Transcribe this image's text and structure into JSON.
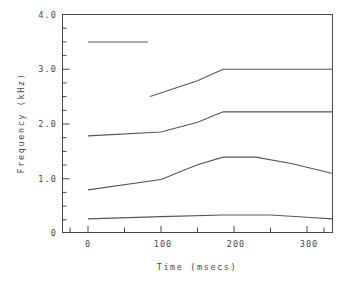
{
  "chart_data": {
    "type": "line",
    "title": "",
    "xlabel": "Time (msecs)",
    "ylabel": "Frequency (kHz)",
    "xlim": [
      -35,
      340
    ],
    "ylim": [
      0,
      4.0
    ],
    "grid": false,
    "legend": "none",
    "x_ticks": [
      0,
      100,
      200,
      300
    ],
    "x_tick_labels": [
      "0",
      "100",
      "200",
      "300"
    ],
    "x_minor_ticks": [
      -50,
      50,
      150,
      250,
      350
    ],
    "y_ticks": [
      0,
      1.0,
      2.0,
      3.0,
      4.0
    ],
    "y_tick_labels": [
      "0",
      "1.0",
      "2.0",
      "3.0",
      "4.0"
    ],
    "y_minor_ticks": [
      0.25,
      0.5,
      0.75,
      1.25,
      1.5,
      1.75,
      2.25,
      2.5,
      2.75,
      3.25,
      3.5,
      3.75
    ],
    "series": [
      {
        "name": "F4",
        "x": [
          0,
          82
        ],
        "values": [
          3.49,
          3.49
        ]
      },
      {
        "name": "F3",
        "x": [
          85,
          150,
          185,
          250,
          335
        ],
        "values": [
          2.49,
          2.78,
          2.99,
          2.99,
          2.99
        ]
      },
      {
        "name": "F2",
        "x": [
          0,
          100,
          150,
          185,
          250,
          335
        ],
        "values": [
          1.77,
          1.84,
          2.02,
          2.21,
          2.21,
          2.21
        ]
      },
      {
        "name": "F1",
        "x": [
          0,
          100,
          150,
          185,
          230,
          280,
          335
        ],
        "values": [
          0.78,
          0.97,
          1.24,
          1.38,
          1.38,
          1.26,
          1.08
        ]
      },
      {
        "name": "F0",
        "x": [
          0,
          100,
          185,
          250,
          300,
          335
        ],
        "values": [
          0.25,
          0.29,
          0.32,
          0.32,
          0.28,
          0.25
        ]
      }
    ]
  },
  "axes": {
    "y_title": "Frequency (kHz)",
    "x_title": "Time (msecs)"
  }
}
